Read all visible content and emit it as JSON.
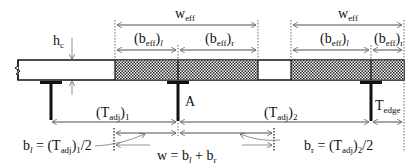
{
  "diagram": {
    "labels": {
      "hc": "h",
      "hc_sub": "c",
      "weff_left": "w",
      "weff_left_sub": "eff",
      "weff_right": "w",
      "weff_right_sub": "eff",
      "beff_l1_open": "(b",
      "beff_l1_sub": "eff",
      "beff_l1_close": ")",
      "beff_l1_side": "l",
      "beff_r1_open": "(b",
      "beff_r1_sub": "eff",
      "beff_r1_close": ")",
      "beff_r1_side": "r",
      "beff_l2_open": "(b",
      "beff_l2_sub": "eff",
      "beff_l2_close": ")",
      "beff_l2_side": "l",
      "beff_r2_open": "(b",
      "beff_r2_sub": "eff",
      "beff_r2_close": ")",
      "beff_r2_side": "r",
      "girder_a": "A",
      "tadj1_open": "(T",
      "tadj1_sub": "adj",
      "tadj1_close": ")",
      "tadj1_idx": "1",
      "tadj2_open": "(T",
      "tadj2_sub": "adj",
      "tadj2_close": ")",
      "tadj2_idx": "2",
      "tedge": "T",
      "tedge_sub": "edge",
      "bl_eq_b": "b",
      "bl_eq_bsub": "l",
      "bl_eq_mid": " = (T",
      "bl_eq_tsub": "adj",
      "bl_eq_close": ")",
      "bl_eq_idx": "1",
      "bl_eq_end": "/2",
      "br_eq_b": "b",
      "br_eq_bsub": "r",
      "br_eq_mid": " = (T",
      "br_eq_tsub": "adj",
      "br_eq_close": ")",
      "br_eq_idx": "2",
      "br_eq_end": "/2",
      "w_eq_w": "w = b",
      "w_eq_sub1": "l",
      "w_eq_plus": " + b",
      "w_eq_sub2": "r"
    },
    "colors": {
      "line": "#111111",
      "dim": "#666666",
      "hatch": "#333333"
    }
  }
}
